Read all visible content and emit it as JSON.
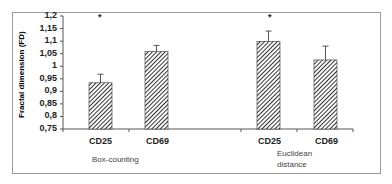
{
  "chart_data": {
    "type": "bar",
    "title": "",
    "xlabel": "",
    "ylabel": "Fractal dimension (FD)",
    "ylim": [
      0.75,
      1.2
    ],
    "y_ticks": [
      "1,2",
      "1,15",
      "1,1",
      "1,05",
      "1",
      "0,95",
      "0,9",
      "0,85",
      "0,8",
      "0,75"
    ],
    "grid": false,
    "groups": [
      {
        "name": "Box-counting",
        "bars": [
          {
            "category": "CD25",
            "value": 0.934,
            "error": 0.034,
            "significance": "*"
          },
          {
            "category": "CD69",
            "value": 1.058,
            "error": 0.025,
            "significance": ""
          }
        ]
      },
      {
        "name": "Euclidean distance",
        "bars": [
          {
            "category": "CD25",
            "value": 1.099,
            "error": 0.041,
            "significance": "*"
          },
          {
            "category": "CD69",
            "value": 1.025,
            "error": 0.055,
            "significance": ""
          }
        ]
      }
    ],
    "categories": [
      "CD25",
      "CD69",
      "CD25",
      "CD69"
    ],
    "values": [
      0.934,
      1.058,
      1.099,
      1.025
    ]
  },
  "labels": {
    "ylabel": "Fractal dimension (FD)",
    "group1": "Box-counting",
    "group2_line1": "Euclidean",
    "group2_line2": "distance",
    "cat1": "CD25",
    "cat2": "CD69",
    "cat3": "CD25",
    "cat4": "CD69",
    "star": "*",
    "ticks": [
      "1,2",
      "1,15",
      "1,1",
      "1,05",
      "1",
      "0,95",
      "0,9",
      "0,85",
      "0,8",
      "0,75"
    ]
  }
}
